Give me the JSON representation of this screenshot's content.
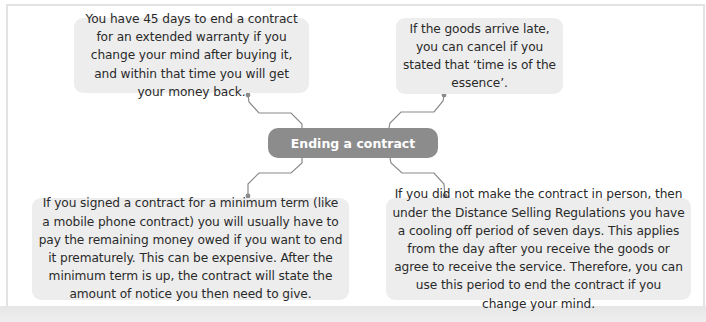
{
  "diagram": {
    "type": "mind-map",
    "center": {
      "label": "Ending a contract",
      "color": "#8c8c8c",
      "text_color": "#ffffff"
    },
    "branches": [
      {
        "position": "top-left",
        "text": "You have 45 days to end a contract for an extended warranty if you change your mind after buying it, and within that time you will get your money back."
      },
      {
        "position": "top-right",
        "text": "If the goods arrive late, you can cancel if you stated that ‘time is of the essence’."
      },
      {
        "position": "bottom-left",
        "text": "If you signed a contract for a minimum term (like a mobile phone contract) you will usually have to pay the remaining money owed if you want to end it prematurely. This can be expensive. After the minimum term is up, the contract will state the amount of notice you then need to give."
      },
      {
        "position": "bottom-right",
        "text": "If you did not make the contract in person, then under the Distance Selling Regulations you have a cooling off period of seven days. This applies from the day after you receive the goods or agree to receive the service. Therefore, you can use this period to end the contract if you change your mind."
      }
    ],
    "colors": {
      "note_background": "#ededed",
      "connector": "#8a8a8a",
      "frame_border": "#e3e3e3"
    }
  }
}
